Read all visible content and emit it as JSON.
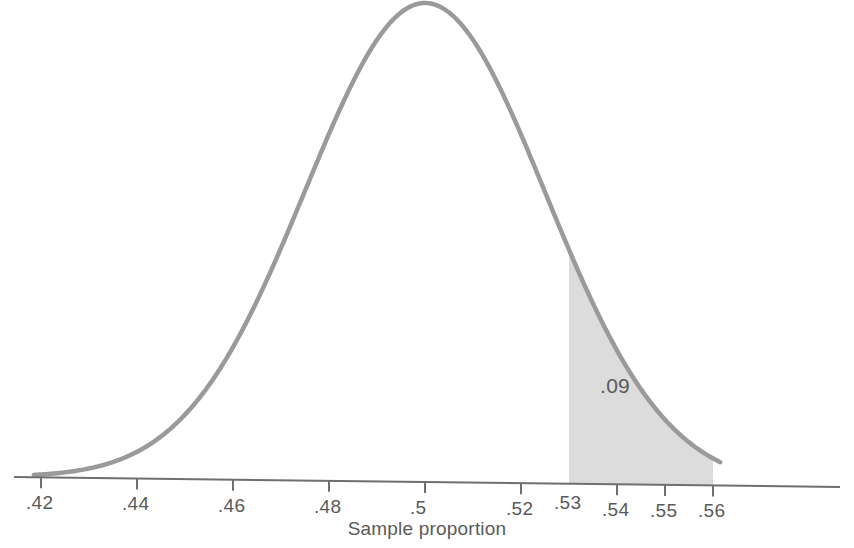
{
  "figure": {
    "axis_title": "Sample proportion",
    "area_label": ".09"
  },
  "axis": {
    "tick_labels": [
      ".42",
      ".44",
      ".46",
      ".48",
      ".5",
      ".52",
      ".53",
      ".54",
      ".55",
      ".56"
    ]
  },
  "colors": {
    "curve": "#9a9a9a",
    "shade": "#dcdcdc",
    "axis": "#6f6f6f",
    "text": "#5a5a5a",
    "background": "#ffffff"
  },
  "chart_data": {
    "type": "area",
    "title": "",
    "subtitle": "",
    "xlabel": "Sample proportion",
    "ylabel": "",
    "grid": false,
    "legend": null,
    "distribution": "normal",
    "mean": 0.5,
    "std_dev": 0.025,
    "xlim": [
      0.42,
      0.56
    ],
    "ylim": [
      0,
      1
    ],
    "tick_values": [
      0.42,
      0.44,
      0.46,
      0.48,
      0.5,
      0.52,
      0.53,
      0.54,
      0.55,
      0.56
    ],
    "tick_labels": [
      ".42",
      ".44",
      ".46",
      ".48",
      ".5",
      ".52",
      ".53",
      ".54",
      ".55",
      ".56"
    ],
    "ticks_with_marks": [
      0.42,
      0.44,
      0.46,
      0.48,
      0.5,
      0.52,
      0.54,
      0.55,
      0.56
    ],
    "shaded_region": {
      "from": 0.53,
      "to": 0.56,
      "tail": "right",
      "area": 0.09,
      "label": ".09"
    },
    "annotations": [
      {
        "text": ".09",
        "x": 0.5365,
        "y": 0.175
      }
    ],
    "curve_x": [
      0.42,
      0.424,
      0.428,
      0.432,
      0.436,
      0.44,
      0.444,
      0.448,
      0.452,
      0.456,
      0.46,
      0.464,
      0.468,
      0.472,
      0.476,
      0.48,
      0.484,
      0.488,
      0.492,
      0.496,
      0.5,
      0.504,
      0.508,
      0.512,
      0.516,
      0.52,
      0.524,
      0.528,
      0.53,
      0.532,
      0.536,
      0.54,
      0.544,
      0.548,
      0.552,
      0.556,
      0.56
    ],
    "curve_y": [
      0.008,
      0.013,
      0.02,
      0.029,
      0.042,
      0.059,
      0.081,
      0.109,
      0.144,
      0.186,
      0.237,
      0.295,
      0.36,
      0.43,
      0.502,
      0.577,
      0.65,
      0.718,
      0.779,
      0.835,
      0.885,
      0.835,
      0.779,
      0.718,
      0.65,
      0.577,
      0.502,
      0.43,
      0.394,
      0.36,
      0.295,
      0.237,
      0.186,
      0.144,
      0.109,
      0.081,
      0.059
    ]
  }
}
